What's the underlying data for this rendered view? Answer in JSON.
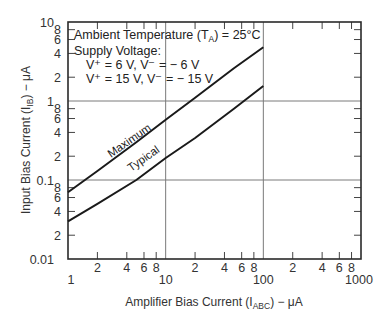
{
  "chart_data": {
    "type": "line",
    "title": "",
    "xlabel": "Amplifier Bias Current (I_ABC) − μA",
    "ylabel": "Input Bias Current (I_IB) − μA",
    "xscale": "log",
    "yscale": "log",
    "xlim": [
      1,
      1000
    ],
    "ylim": [
      0.01,
      10
    ],
    "grid": "decade gridlines",
    "x_tick_labels": [
      "1",
      "2",
      "4",
      "6",
      "8",
      "10",
      "2",
      "4",
      "6",
      "8",
      "100",
      "2",
      "4",
      "6",
      "8",
      "1000"
    ],
    "y_tick_labels": [
      "0.01",
      "2",
      "4",
      "6",
      "8",
      "0.1",
      "2",
      "4",
      "6",
      "8",
      "1",
      "2",
      "4",
      "6",
      "8",
      "10"
    ],
    "annotations": [
      "Ambient Temperature (T_A) = 25°C",
      "Supply Voltage:",
      "V+ = 6 V, V− = − 6 V",
      "V+ = 15 V, V− = − 15 V"
    ],
    "series": [
      {
        "name": "Maximum",
        "x": [
          1,
          2,
          5,
          10,
          20,
          50,
          100
        ],
        "values": [
          0.07,
          0.13,
          0.3,
          0.58,
          1.1,
          2.6,
          4.8
        ]
      },
      {
        "name": "Typical",
        "x": [
          1,
          2,
          5,
          10,
          20,
          50,
          100
        ],
        "values": [
          0.03,
          0.05,
          0.1,
          0.19,
          0.34,
          0.8,
          1.55
        ]
      }
    ]
  },
  "labels": {
    "y_title_main": "Input Bias Current (I",
    "y_title_sub": "IB",
    "y_title_end": ") − μA",
    "x_title_main": "Amplifier Bias Current (I",
    "x_title_sub": "ABC",
    "x_title_end": ") − μA",
    "annot_temp_a": "Ambient Temperature (T",
    "annot_temp_sub": "A",
    "annot_temp_b": ") = 25°C",
    "annot_supply": "Supply Voltage:",
    "annot_v1": "V⁺ = 6 V, V⁻ = − 6 V",
    "annot_v2": "V⁺ = 15 V, V⁻ = − 15 V",
    "max_label": "Maximum",
    "typ_label": "Typical"
  }
}
